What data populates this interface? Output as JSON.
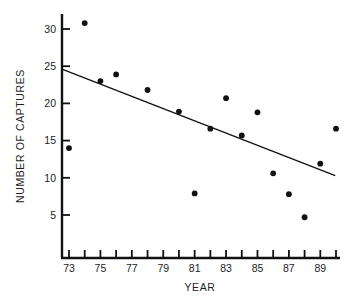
{
  "chart_data": {
    "type": "scatter",
    "title": "",
    "xlabel": "YEAR",
    "ylabel": "NUMBER OF CAPTURES",
    "xlim": [
      72,
      90.6
    ],
    "ylim": [
      0,
      32.5
    ],
    "grid": false,
    "legend": null,
    "x_tick_labels": [
      "73",
      "75",
      "77",
      "79",
      "81",
      "83",
      "85",
      "87",
      "89"
    ],
    "x_tick_values": [
      73,
      75,
      77,
      79,
      81,
      83,
      85,
      87,
      89
    ],
    "x_minor_tick_values": [
      73,
      74,
      75,
      76,
      77,
      78,
      79,
      80,
      81,
      82,
      83,
      84,
      85,
      86,
      87,
      88,
      89,
      90
    ],
    "y_tick_labels": [
      "5",
      "10",
      "15",
      "20",
      "25",
      "30"
    ],
    "y_tick_values": [
      5,
      10,
      15,
      20,
      25,
      30
    ],
    "x": [
      73,
      74,
      75,
      76,
      78,
      80,
      81,
      82,
      83,
      84,
      85,
      86,
      87,
      88,
      89,
      90
    ],
    "values": [
      14.0,
      30.8,
      23.0,
      23.9,
      21.8,
      18.9,
      7.9,
      16.6,
      20.7,
      15.7,
      18.8,
      10.6,
      7.8,
      4.7,
      11.9,
      16.6
    ],
    "series": [
      {
        "name": "captures",
        "marker": "filled-circle",
        "color": "#111111",
        "points": [
          {
            "x": 73,
            "y": 14.0
          },
          {
            "x": 74,
            "y": 30.8
          },
          {
            "x": 75,
            "y": 23.0
          },
          {
            "x": 76,
            "y": 23.9
          },
          {
            "x": 78,
            "y": 21.8
          },
          {
            "x": 80,
            "y": 18.9
          },
          {
            "x": 81,
            "y": 7.9
          },
          {
            "x": 82,
            "y": 16.6
          },
          {
            "x": 83,
            "y": 20.7
          },
          {
            "x": 84,
            "y": 15.7
          },
          {
            "x": 85,
            "y": 18.8
          },
          {
            "x": 86,
            "y": 10.6
          },
          {
            "x": 87,
            "y": 7.8
          },
          {
            "x": 88,
            "y": 4.7
          },
          {
            "x": 89,
            "y": 11.9
          },
          {
            "x": 90,
            "y": 16.6
          }
        ]
      }
    ],
    "trendline": {
      "name": "regression-line",
      "color": "#111111",
      "x_start": 72.55,
      "y_start": 24.6,
      "x_end": 89.95,
      "y_end": 10.3
    }
  },
  "axes": {
    "y_axis_title": "NUMBER OF CAPTURES",
    "x_axis_title": "YEAR"
  }
}
